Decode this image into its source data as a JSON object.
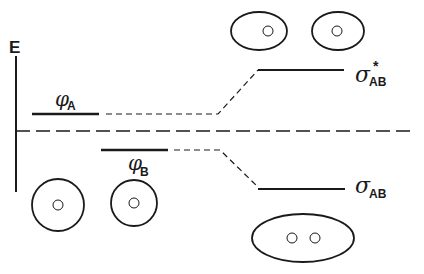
{
  "diagram": {
    "type": "molecular-orbital-energy-diagram",
    "axis": {
      "label": "E"
    },
    "atomic_orbitals": [
      {
        "symbol": "φ",
        "subscript": "A"
      },
      {
        "symbol": "φ",
        "subscript": "B"
      }
    ],
    "molecular_orbitals": [
      {
        "symbol": "σ",
        "subscript": "AB",
        "superscript": "*",
        "type": "antibonding"
      },
      {
        "symbol": "σ",
        "subscript": "AB",
        "superscript": "",
        "type": "bonding"
      }
    ],
    "colors": {
      "line": "#1a1a1a",
      "background": "#ffffff"
    }
  }
}
